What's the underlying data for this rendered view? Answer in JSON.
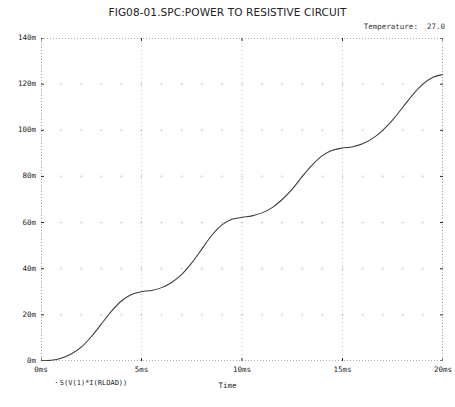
{
  "chart_data": {
    "type": "line",
    "title": "FIG08-01.SPC:POWER TO RESISTIVE CIRCUIT",
    "annotation": "Temperature:  27.0",
    "xlabel": "Time",
    "ylabel": "",
    "legend": "S(V(1)*I(RLOAD))",
    "legend_marker": "·",
    "legend_position": "bottom-left",
    "grid": true,
    "grid_style": "dotted",
    "xlim": [
      0,
      20
    ],
    "ylim": [
      0,
      140
    ],
    "x_unit": "ms",
    "y_unit": "m",
    "xticks": [
      0,
      5,
      10,
      15,
      20
    ],
    "xtick_labels": [
      "0ms",
      "5ms",
      "10ms",
      "15ms",
      "20ms"
    ],
    "x_minor_step": 1,
    "yticks": [
      0,
      20,
      40,
      60,
      80,
      100,
      120,
      140
    ],
    "ytick_labels": [
      "0m",
      "20m",
      "40m",
      "60m",
      "80m",
      "100m",
      "120m",
      "140m"
    ],
    "y_minor_step": 5,
    "series": [
      {
        "name": "S(V(1)*I(RLOAD))",
        "color": "#3b3b3b",
        "x": [
          0.0,
          0.5,
          1.0,
          1.5,
          2.0,
          2.5,
          3.0,
          3.5,
          4.0,
          4.5,
          5.0,
          5.5,
          6.0,
          6.5,
          7.0,
          7.5,
          8.0,
          8.5,
          9.0,
          9.5,
          10.0,
          10.5,
          11.0,
          11.5,
          12.0,
          12.5,
          13.0,
          13.5,
          14.0,
          14.5,
          15.0,
          15.5,
          16.0,
          16.5,
          17.0,
          17.5,
          18.0,
          18.5,
          19.0,
          19.5,
          20.0
        ],
        "y": [
          0.0,
          0.3,
          1.2,
          3.0,
          6.0,
          10.5,
          16.0,
          21.5,
          26.0,
          28.8,
          30.0,
          30.6,
          31.8,
          34.0,
          37.5,
          42.5,
          48.5,
          54.5,
          59.0,
          61.4,
          62.3,
          62.9,
          64.2,
          66.5,
          70.0,
          74.5,
          80.0,
          85.0,
          89.0,
          91.3,
          92.3,
          92.9,
          94.2,
          96.5,
          100.0,
          104.5,
          110.0,
          115.5,
          120.0,
          123.0,
          124.2
        ]
      }
    ]
  },
  "footer_strip": ""
}
